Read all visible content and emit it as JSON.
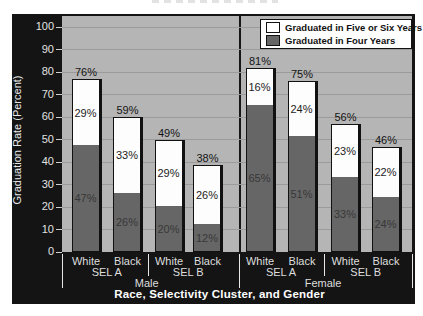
{
  "chart_data": {
    "type": "bar",
    "stacked": true,
    "ylabel": "Graduation Rate (Percent)",
    "xlabel": "Race, Selectivity Cluster, and Gender",
    "ylim": [
      0,
      100
    ],
    "yticks": [
      100,
      90,
      80,
      70,
      60,
      50,
      40,
      30,
      20,
      10,
      0
    ],
    "grid": "horizontal",
    "legend_position": "top-right",
    "legend": [
      {
        "label": "Graduated in Five or Six Years",
        "color": "#ffffff"
      },
      {
        "label": "Graduated in Four Years",
        "color": "#666666"
      }
    ],
    "groups": [
      {
        "gender": "Male",
        "clusters": [
          {
            "name": "SEL A",
            "bars": [
              {
                "race": "White",
                "four_years": 47,
                "five_or_six_years": 29,
                "total": 76
              },
              {
                "race": "Black",
                "four_years": 26,
                "five_or_six_years": 33,
                "total": 59
              }
            ]
          },
          {
            "name": "SEL B",
            "bars": [
              {
                "race": "White",
                "four_years": 20,
                "five_or_six_years": 29,
                "total": 49
              },
              {
                "race": "Black",
                "four_years": 12,
                "five_or_six_years": 26,
                "total": 38
              }
            ]
          }
        ]
      },
      {
        "gender": "Female",
        "clusters": [
          {
            "name": "SEL A",
            "bars": [
              {
                "race": "White",
                "four_years": 65,
                "five_or_six_years": 16,
                "total": 81
              },
              {
                "race": "Black",
                "four_years": 51,
                "five_or_six_years": 24,
                "total": 75
              }
            ]
          },
          {
            "name": "SEL B",
            "bars": [
              {
                "race": "White",
                "four_years": 33,
                "five_or_six_years": 23,
                "total": 56
              },
              {
                "race": "Black",
                "four_years": 24,
                "five_or_six_years": 22,
                "total": 46
              }
            ]
          }
        ]
      }
    ],
    "colors": {
      "plot_background": "#b5b5b5",
      "frame_background": "#141414",
      "gridline": "#9b9b9b",
      "four_years_fill": "#666666",
      "five_or_six_years_fill": "#ffffff"
    }
  }
}
